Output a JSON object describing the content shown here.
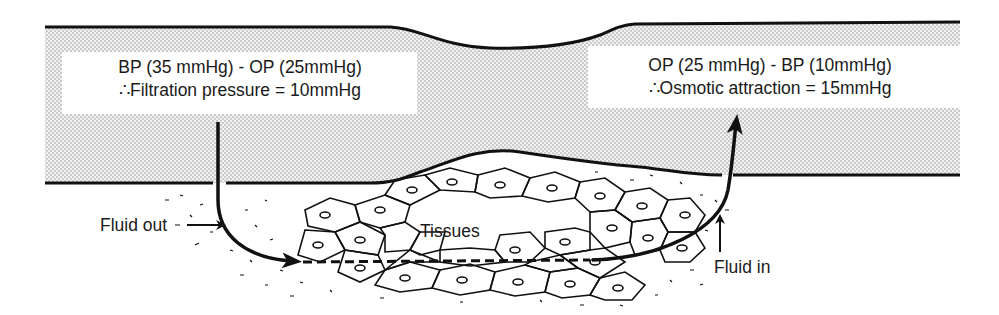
{
  "diagram": {
    "left_label": {
      "line1": "BP (35 mmHg) - OP (25mmHg)",
      "line2": "∴Filtration pressure = 10mmHg"
    },
    "right_label": {
      "line1": "OP (25 mmHg) - BP (10mmHg)",
      "line2": "∴Osmotic attraction = 15mmHg"
    },
    "tissues_label": "Tissues",
    "fluid_out_label": "Fluid out",
    "fluid_in_label": "Fluid in",
    "colors": {
      "line": "#111111",
      "stipple": "#d9d9d9",
      "background": "#ffffff"
    },
    "icons": {
      "fluid_out_arrow": "arrow-right-icon",
      "fluid_in_arrow": "arrow-up-icon"
    }
  }
}
